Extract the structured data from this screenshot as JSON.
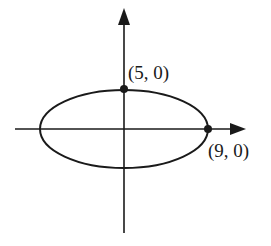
{
  "diagram": {
    "type": "ellipse-on-axes",
    "colors": {
      "stroke": "#1a1a1a",
      "background": "#ffffff"
    },
    "axes": {
      "x_axis": {
        "arrow": "right"
      },
      "y_axis": {
        "arrow": "up"
      }
    },
    "ellipse": {
      "center": [
        0,
        0
      ],
      "orientation": "horizontal-major"
    },
    "points": [
      {
        "id": "top-vertex",
        "label": "(5, 0)"
      },
      {
        "id": "right-vertex",
        "label": "(9, 0)"
      }
    ]
  }
}
